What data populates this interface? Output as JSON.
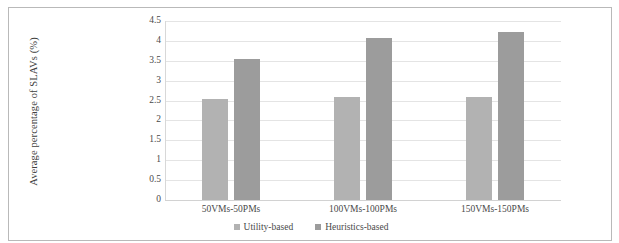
{
  "chart_data": {
    "type": "bar",
    "title": "",
    "xlabel": "",
    "ylabel": "Average percentage of SLAVs (%)",
    "categories": [
      "50VMs-50PMs",
      "100VMs-100PMs",
      "150VMs-150PMs"
    ],
    "series": [
      {
        "name": "Utility-based",
        "values": [
          2.55,
          2.6,
          2.6
        ],
        "color": "#b2b2b2"
      },
      {
        "name": "Heuristics-based",
        "values": [
          3.55,
          4.08,
          4.22
        ],
        "color": "#9c9c9c"
      }
    ],
    "ylim": [
      0,
      4.5
    ],
    "yticks": [
      0,
      0.5,
      1,
      1.5,
      2,
      2.5,
      3,
      3.5,
      4,
      4.5
    ],
    "ytick_labels": [
      "0",
      "0.5",
      "1",
      "1.5",
      "2",
      "2.5",
      "3",
      "3.5",
      "4",
      "4.5"
    ],
    "grid": true,
    "legend_position": "bottom",
    "annotations": []
  },
  "figure": {
    "border_color": "#b9b9b9",
    "background": "#ffffff"
  }
}
